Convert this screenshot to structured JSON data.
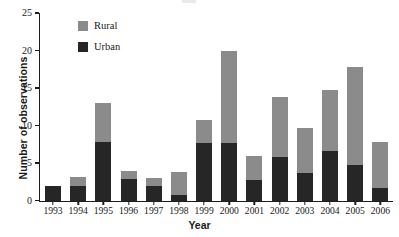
{
  "chart_data": {
    "type": "bar",
    "stacked": true,
    "title": "",
    "xlabel": "Year",
    "ylabel": "Number of observations",
    "categories": [
      "1993",
      "1994",
      "1995",
      "1996",
      "1997",
      "1998",
      "1999",
      "2000",
      "2001",
      "2002",
      "2003",
      "2004",
      "2005",
      "2006"
    ],
    "series": [
      {
        "name": "Urban",
        "color": "#262626",
        "values": [
          2.0,
          1.9,
          7.8,
          2.9,
          1.9,
          0.7,
          7.7,
          7.7,
          2.8,
          5.8,
          3.7,
          6.6,
          4.8,
          1.7
        ]
      },
      {
        "name": "Rural",
        "color": "#8b8b8b",
        "values": [
          0.0,
          1.2,
          5.2,
          1.1,
          1.1,
          3.1,
          3.1,
          12.2,
          3.2,
          8.0,
          6.0,
          8.2,
          13.0,
          6.1
        ]
      }
    ],
    "totals": [
      2.0,
      3.1,
      13.0,
      4.0,
      3.0,
      3.8,
      10.8,
      19.9,
      6.0,
      13.8,
      9.7,
      14.8,
      17.8,
      7.8
    ],
    "ylim": [
      0,
      25
    ],
    "yticks": [
      0,
      5,
      10,
      15,
      20,
      25
    ],
    "ytick_labels": [
      "0",
      "5",
      "10",
      "15",
      "20",
      "25"
    ],
    "grid": false,
    "legend_position": "top-left-inside",
    "legend": [
      "Rural",
      "Urban"
    ]
  },
  "axes": {
    "y_title": "Number of observations",
    "x_title": "Year"
  },
  "legend": {
    "items": [
      {
        "label": "Rural",
        "color": "#8b8b8b"
      },
      {
        "label": "Urban",
        "color": "#262626"
      }
    ]
  },
  "colors": {
    "rural": "#8b8b8b",
    "urban": "#262626",
    "axis": "#1d1d1d",
    "background": "#ffffff"
  }
}
